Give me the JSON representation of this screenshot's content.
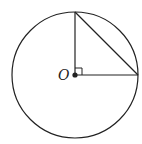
{
  "diagram": {
    "type": "geometry",
    "center_label": "O",
    "circle": {
      "cx": 75,
      "cy": 75,
      "r": 63
    },
    "radius_vertical": {
      "x1": 75,
      "y1": 75,
      "x2": 75,
      "y2": 12
    },
    "radius_horizontal": {
      "x1": 75,
      "y1": 75,
      "x2": 138,
      "y2": 75
    },
    "chord": {
      "x1": 75,
      "y1": 12,
      "x2": 138,
      "y2": 75
    },
    "right_angle_marker": true,
    "stroke_color": "#222222"
  }
}
